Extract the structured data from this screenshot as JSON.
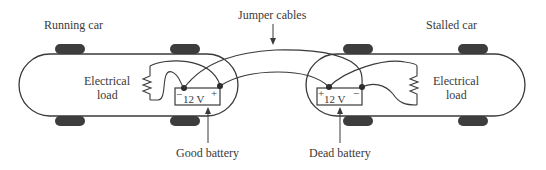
{
  "diagram": {
    "labels": {
      "running_car": "Running car",
      "stalled_car": "Stalled car",
      "jumper_cables": "Jumper cables",
      "left_load_line1": "Electrical",
      "left_load_line2": "load",
      "right_load_line1": "Electrical",
      "right_load_line2": "load",
      "good_battery": "Good battery",
      "dead_battery": "Dead battery"
    },
    "good_battery": {
      "voltage": "12 V",
      "left_terminal": "−",
      "right_terminal": "+"
    },
    "dead_battery": {
      "voltage": "12 V",
      "left_terminal": "+",
      "right_terminal": "−"
    },
    "colors": {
      "line": "#3a3a3a",
      "wheel": "#3d3d3d",
      "background": "#ffffff"
    }
  }
}
